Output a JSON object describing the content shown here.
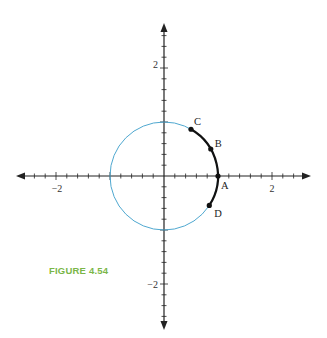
{
  "figure": {
    "caption": "FIGURE 4.54",
    "caption_color": "#7ab648"
  },
  "axes": {
    "x_tick_labels": [
      "−2",
      "2"
    ],
    "y_tick_labels": [
      "2",
      "−2"
    ],
    "range": [
      -2.7,
      2.7
    ],
    "minor_tick_step": 0.2
  },
  "circle": {
    "type": "unit circle",
    "radius": 1,
    "color": "#4fa8d0"
  },
  "arc": {
    "from": "D",
    "to": "C",
    "color": "#111111"
  },
  "points": [
    {
      "label": "A",
      "angle_deg": 0
    },
    {
      "label": "B",
      "angle_deg": 30
    },
    {
      "label": "C",
      "angle_deg": 60
    },
    {
      "label": "D",
      "angle_deg": -33
    }
  ]
}
